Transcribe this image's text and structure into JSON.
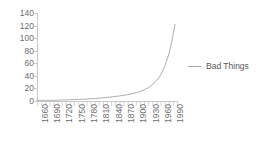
{
  "chart_data": {
    "type": "line",
    "title": "",
    "xlabel": "",
    "ylabel": "",
    "xlim": [
      1660,
      2000
    ],
    "ylim": [
      0,
      140
    ],
    "grid": false,
    "legend_position": "right",
    "y_ticks": [
      140,
      120,
      100,
      80,
      60,
      40,
      20,
      0
    ],
    "x_ticks": [
      1660,
      1690,
      1720,
      1750,
      1780,
      1810,
      1840,
      1870,
      1900,
      1930,
      1960,
      1990
    ],
    "x_minor_tick_interval": 10,
    "line_color": "#a6a6a6",
    "axis_color": "#c9c9c9",
    "text_color": "#6d6d6d",
    "series": [
      {
        "name": "Bad Things",
        "color": "#a6a6a6",
        "x": [
          1660,
          1680,
          1700,
          1720,
          1740,
          1760,
          1780,
          1800,
          1820,
          1840,
          1860,
          1880,
          1900,
          1910,
          1920,
          1930,
          1940,
          1950,
          1960,
          1970,
          1980,
          1990,
          1995
        ],
        "values": [
          1,
          1,
          1,
          1.5,
          2,
          2.5,
          3,
          4,
          5,
          6.5,
          8,
          10,
          13,
          15,
          18,
          21,
          26,
          32,
          41,
          55,
          74,
          103,
          122
        ]
      }
    ]
  },
  "legend": {
    "label": "Bad Things"
  }
}
